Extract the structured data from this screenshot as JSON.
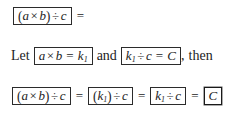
{
  "figure": {
    "name": "associative-division-derivation",
    "background_color": "#ffffff",
    "text_color": "#1c1c1c",
    "box_border_color": "#2b2b2b"
  },
  "symbols": {
    "times": "×",
    "divide": "÷",
    "equals": "=",
    "lparen": "(",
    "rparen": ")"
  },
  "line1": {
    "box1": {
      "lparen": "(",
      "a": "a",
      "times": "×",
      "b": "b",
      "rparen": ")",
      "divide": "÷",
      "c": "c"
    },
    "trailing_equals": "="
  },
  "line2": {
    "let_word": "Let",
    "box1": {
      "a": "a",
      "times": "×",
      "b": "b",
      "equals": "=",
      "k": "k",
      "k_sub": "1"
    },
    "and_word": "and",
    "box2": {
      "k": "k",
      "k_sub": "1",
      "divide": "÷",
      "c": "c",
      "equals": "=",
      "C": "C"
    },
    "comma": ",",
    "then_word": "then"
  },
  "line3": {
    "box1": {
      "lparen": "(",
      "a": "a",
      "times": "×",
      "b": "b",
      "rparen": ")",
      "divide": "÷",
      "c": "c"
    },
    "eq1": "=",
    "box2": {
      "lparen": "(",
      "k": "k",
      "k_sub": "1",
      "rparen": ")",
      "divide": "÷",
      "c": "c"
    },
    "eq2": "=",
    "box3": {
      "k": "k",
      "k_sub": "1",
      "divide": "÷",
      "c": "c"
    },
    "eq3": "=",
    "box4": {
      "C": "C"
    }
  }
}
